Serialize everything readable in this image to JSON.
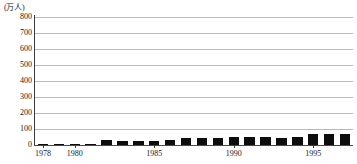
{
  "chart_data": {
    "type": "bar",
    "title": "",
    "subtitle": "",
    "xlabel": "",
    "ylabel": "",
    "unit_label": "(万人)",
    "ylim": [
      0,
      800
    ],
    "ytick_step": 100,
    "yticks": [
      "800",
      "700",
      "600",
      "500",
      "400",
      "300",
      "200",
      "100",
      "0"
    ],
    "grid": true,
    "legend": false,
    "bar_color": "#0d0d0d",
    "grid_color": "#b9b9b9",
    "axis_color": "#3a3a3a",
    "xtick_labels": [
      "1978",
      "1980",
      "1985",
      "1990",
      "1995"
    ],
    "xtick_years": [
      1978,
      1980,
      1985,
      1990,
      1995
    ],
    "categories": [
      "1978",
      "1979",
      "1980",
      "1981",
      "1982",
      "1983",
      "1984",
      "1985",
      "1986",
      "1987",
      "1988",
      "1989",
      "1990",
      "1991",
      "1992",
      "1993",
      "1994",
      "1995",
      "1996",
      "1997"
    ],
    "values": [
      6,
      3,
      7,
      6,
      34,
      25,
      22,
      23,
      29,
      41,
      41,
      45,
      47,
      49,
      48,
      45,
      51,
      68,
      70,
      69
    ]
  }
}
